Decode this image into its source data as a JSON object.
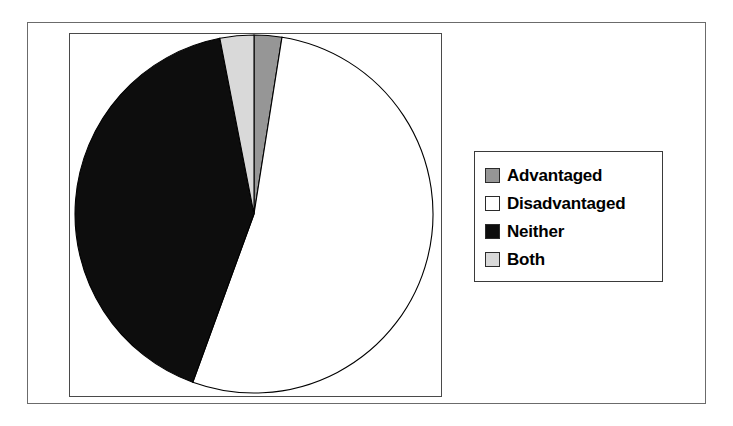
{
  "chart_data": {
    "type": "pie",
    "title": "",
    "subtitle": "",
    "xlabel": "",
    "ylabel": "",
    "grid": false,
    "legend_position": "right",
    "start_angle_deg": 0,
    "direction": "clockwise",
    "categories": [
      "Advantaged",
      "Disadvantaged",
      "Neither",
      "Both"
    ],
    "values": [
      2.5,
      53.0,
      41.4,
      3.1
    ],
    "value_unit": "percent",
    "slices": [
      {
        "label": "Advantaged",
        "value": 2.5,
        "start_angle_deg": 0,
        "end_angle_deg": 9,
        "sweep_deg": 9,
        "color": "#969696",
        "border": "#000000"
      },
      {
        "label": "Disadvantaged",
        "value": 53.0,
        "start_angle_deg": 9,
        "end_angle_deg": 200,
        "sweep_deg": 191,
        "color": "#ffffff",
        "border": "#000000"
      },
      {
        "label": "Neither",
        "value": 41.4,
        "start_angle_deg": 200,
        "end_angle_deg": 349,
        "sweep_deg": 149,
        "color": "#0d0d0d",
        "border": "#000000"
      },
      {
        "label": "Both",
        "value": 3.1,
        "start_angle_deg": 349,
        "end_angle_deg": 360,
        "sweep_deg": 11,
        "color": "#d9d9d9",
        "border": "#000000"
      }
    ],
    "geometry": {
      "center_x": 194,
      "center_y": 194,
      "radius": 179
    }
  },
  "legend": {
    "items": [
      {
        "label": "Advantaged",
        "swatch_color": "#969696"
      },
      {
        "label": "Disadvantaged",
        "swatch_color": "#ffffff"
      },
      {
        "label": "Neither",
        "swatch_color": "#0d0d0d"
      },
      {
        "label": "Both",
        "swatch_color": "#d9d9d9"
      }
    ]
  },
  "colors": {
    "figure_background": "#ffffff",
    "outer_frame": "#6b6b6b",
    "plot_frame": "#4a4a4a",
    "legend_frame": "#3a3a3a",
    "slice_outline": "#000000",
    "text": "#000000"
  }
}
